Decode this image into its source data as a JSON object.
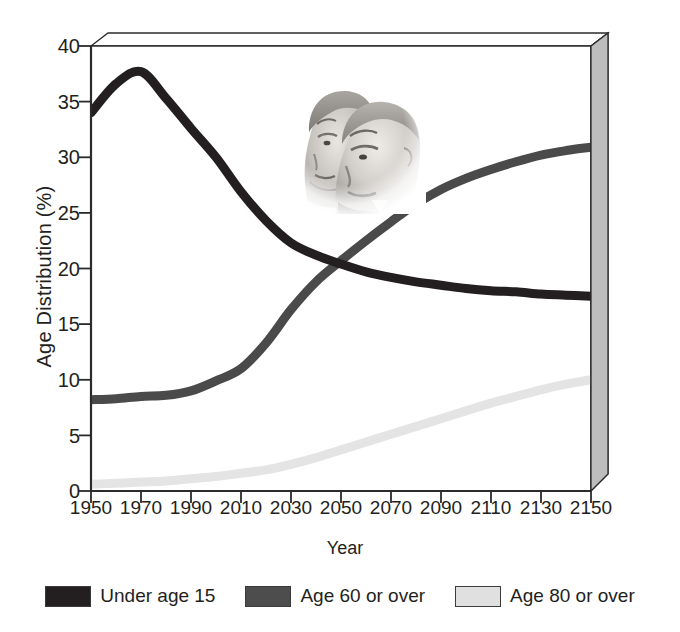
{
  "chart_data": {
    "type": "line",
    "title": "",
    "xlabel": "Year",
    "ylabel": "Age Distribution (%)",
    "xlim": [
      1950,
      2150
    ],
    "ylim": [
      0,
      40
    ],
    "xticks": [
      1950,
      1970,
      1990,
      2010,
      2030,
      2050,
      2070,
      2090,
      2110,
      2130,
      2150
    ],
    "yticks": [
      0,
      5,
      10,
      15,
      20,
      25,
      30,
      35,
      40
    ],
    "grid": false,
    "legend_position": "bottom",
    "x": [
      1950,
      1960,
      1970,
      1980,
      1990,
      2000,
      2010,
      2020,
      2030,
      2040,
      2050,
      2060,
      2070,
      2080,
      2090,
      2100,
      2110,
      2120,
      2130,
      2140,
      2150
    ],
    "series": [
      {
        "name": "Under age 15",
        "color": "#231f20",
        "values": [
          34.0,
          36.6,
          37.7,
          35.3,
          32.6,
          30.0,
          26.9,
          24.3,
          22.3,
          21.2,
          20.4,
          19.7,
          19.2,
          18.8,
          18.5,
          18.2,
          18.0,
          17.9,
          17.7,
          17.6,
          17.5
        ]
      },
      {
        "name": "Age 60 or over",
        "color": "#4a4a4a",
        "values": [
          8.2,
          8.3,
          8.5,
          8.6,
          9.0,
          9.9,
          11.0,
          13.3,
          16.3,
          18.8,
          20.7,
          22.5,
          24.2,
          25.8,
          27.1,
          28.1,
          28.9,
          29.6,
          30.2,
          30.6,
          30.9
        ]
      },
      {
        "name": "Age 80 or over",
        "color": "#e4e4e4",
        "values": [
          0.6,
          0.7,
          0.8,
          0.9,
          1.1,
          1.3,
          1.6,
          1.9,
          2.4,
          3.0,
          3.7,
          4.4,
          5.1,
          5.8,
          6.5,
          7.2,
          7.9,
          8.5,
          9.1,
          9.6,
          10.0
        ]
      }
    ],
    "annotations": [
      {
        "name": "elderly-couple-photo",
        "kind": "image",
        "description": "grayscale photograph of an elderly couple"
      }
    ]
  },
  "axes": {
    "y_title": "Age Distribution (%)",
    "x_title": "Year",
    "y_tick_labels": [
      "40",
      "35",
      "30",
      "25",
      "20",
      "15",
      "10",
      "5",
      "0"
    ],
    "x_tick_labels": [
      "1950",
      "1970",
      "1990",
      "2010",
      "2030",
      "2050",
      "2070",
      "2090",
      "2110",
      "2130",
      "2150"
    ]
  },
  "legend": {
    "items": [
      {
        "label": "Under age 15",
        "color": "#231f20"
      },
      {
        "label": "Age 60 or over",
        "color": "#4d4d4d"
      },
      {
        "label": "Age 80 or over",
        "color": "#e0e0e0"
      }
    ]
  },
  "style": {
    "plot_background": "#ffffff",
    "panel_side_fill": "#bdbdbd",
    "panel_top_fill": "#ffffff",
    "axis_line": "#231f20",
    "text_color": "#231f20"
  }
}
